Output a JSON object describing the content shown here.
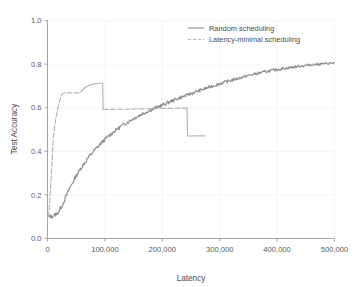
{
  "chart_data": {
    "type": "line",
    "title": "",
    "xlabel": "Latency",
    "ylabel": "Test Accuracy",
    "xlim": [
      0,
      500000
    ],
    "ylim": [
      0.0,
      1.0
    ],
    "grid": true,
    "legend_position": "top-right",
    "xticks": [
      0,
      100000,
      200000,
      300000,
      400000,
      500000
    ],
    "xtick_labels": [
      "0",
      "100,000",
      "200,000",
      "300,000",
      "400,000",
      "500,000"
    ],
    "yticks": [
      0.0,
      0.2,
      0.4,
      0.6,
      0.8,
      1.0
    ],
    "ytick_labels": [
      "0.0",
      "0.2",
      "0.4",
      "0.6",
      "0.8",
      "1.0"
    ],
    "series": [
      {
        "name": "Random scheduling",
        "style": "solid",
        "color": "#8c8c8c",
        "x": [
          0,
          4000,
          8000,
          12000,
          16000,
          20000,
          26000,
          32000,
          40000,
          50000,
          60000,
          72000,
          85000,
          100000,
          115000,
          130000,
          148000,
          165000,
          182000,
          200000,
          220000,
          240000,
          262000,
          285000,
          310000,
          335000,
          360000,
          385000,
          410000,
          435000,
          460000,
          482000,
          500000
        ],
        "y": [
          0.098,
          0.103,
          0.101,
          0.108,
          0.112,
          0.125,
          0.155,
          0.192,
          0.238,
          0.288,
          0.33,
          0.374,
          0.414,
          0.455,
          0.489,
          0.518,
          0.548,
          0.572,
          0.592,
          0.612,
          0.635,
          0.655,
          0.676,
          0.697,
          0.718,
          0.737,
          0.754,
          0.768,
          0.779,
          0.789,
          0.797,
          0.802,
          0.805
        ]
      },
      {
        "name": "Latency-minimal scheduling",
        "style": "dashed",
        "color": "#b5b5b5",
        "segments": [
          {
            "note": "initial steep rise then first plateau",
            "x": [
              0,
              2000,
              4000,
              6000,
              8000,
              10000,
              13000,
              16000,
              19000,
              22000,
              25000,
              30000,
              38000,
              46000,
              55000
            ],
            "y": [
              0.1,
              0.107,
              0.175,
              0.26,
              0.36,
              0.455,
              0.525,
              0.572,
              0.608,
              0.64,
              0.662,
              0.668,
              0.668,
              0.668,
              0.668
            ]
          },
          {
            "note": "second rise to peak then sharp drop",
            "x": [
              58000,
              62000,
              66000,
              71000,
              76000,
              82000,
              88000,
              94000,
              96000,
              96500,
              97000
            ],
            "y": [
              0.672,
              0.684,
              0.694,
              0.701,
              0.706,
              0.709,
              0.711,
              0.712,
              0.712,
              0.65,
              0.592
            ]
          },
          {
            "note": "long mid plateau near 0.595",
            "x": [
              97000,
              110000,
              125000,
              140000,
              155000,
              170000,
              185000,
              200000,
              215000,
              230000,
              240000,
              243000
            ],
            "y": [
              0.592,
              0.592,
              0.593,
              0.593,
              0.594,
              0.595,
              0.596,
              0.597,
              0.597,
              0.598,
              0.598,
              0.598
            ]
          },
          {
            "note": "second sharp drop then final plateau",
            "x": [
              243000,
              243500,
              244000,
              250000,
              258000,
              266000,
              274000
            ],
            "y": [
              0.598,
              0.53,
              0.47,
              0.47,
              0.471,
              0.471,
              0.471
            ]
          }
        ]
      }
    ],
    "annotations": []
  },
  "legend": {
    "entries": [
      {
        "label": "Random scheduling",
        "style": "solid"
      },
      {
        "label": "Latency-minimal scheduling",
        "style": "dashed"
      }
    ]
  },
  "colors": {
    "axis": "#9a9a9a",
    "grid": "#f2f2f2",
    "text": "#4a4a4a",
    "series_solid": "#8c8c8c",
    "series_dashed": "#b5b5b5",
    "background": "#ffffff"
  }
}
